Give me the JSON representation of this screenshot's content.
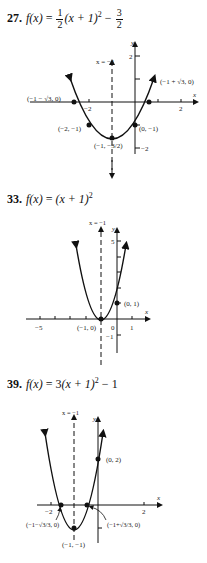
{
  "problems": [
    {
      "number": "27.",
      "lhs": "f(x)",
      "equals": " = ",
      "coef_num": "1",
      "coef_den": "2",
      "middle": "(x + 1)",
      "exp": "2",
      "minus": " − ",
      "const_num": "3",
      "const_den": "2",
      "graph": {
        "axis_of_symmetry": "x = −1",
        "y_label": "y",
        "x_label": "x",
        "y_tick_2": "2",
        "y_tick_neg2": "−2",
        "x_tick_neg2": "−2",
        "x_tick_2": "2",
        "points": {
          "left_root": "(−1 − √3, 0)",
          "right_root": "(−1 + √3, 0)",
          "p_neg2": "(−2, −1)",
          "p_0": "(0, −1)",
          "vertex": "(−1, −3/2)"
        }
      }
    },
    {
      "number": "33.",
      "lhs": "f(x)",
      "equals": " = ",
      "middle": "(x + 1)",
      "exp": "2",
      "graph": {
        "axis_of_symmetry": "x = −1",
        "y_label": "y",
        "x_label": "x",
        "y_tick_5": "5",
        "y_tick_neg1": "−1",
        "x_tick_neg5": "−5",
        "x_tick_0": "0",
        "x_tick_1": "1",
        "points": {
          "vertex": "(−1, 0)",
          "y_int": "(0, 1)"
        }
      }
    },
    {
      "number": "39.",
      "lhs": "f(x)",
      "equals": " = ",
      "coef": "3",
      "middle": "(x + 1)",
      "exp": "2",
      "minus": " − 1",
      "graph": {
        "axis_of_symmetry": "x = −1",
        "y_label": "y",
        "x_label": "x",
        "x_tick_neg2": "−2",
        "x_tick_2": "2",
        "points": {
          "y_int": "(0, 2)",
          "left_root": "(−1−√3/3, 0)",
          "right_root": "(−1+√3/3, 0)",
          "vertex": "(−1, −1)"
        }
      }
    }
  ]
}
